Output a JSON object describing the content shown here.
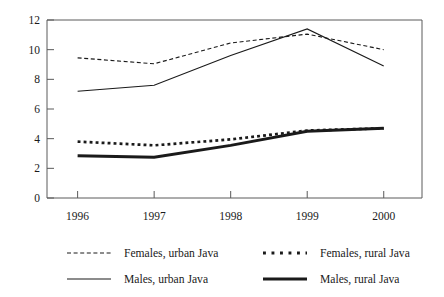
{
  "chart_data": {
    "type": "line",
    "title": "",
    "subtitle": "",
    "xlabel": "",
    "ylabel": "",
    "categories": [
      "1996",
      "1997",
      "1998",
      "1999",
      "2000"
    ],
    "x": [
      1996,
      1997,
      1998,
      1999,
      2000
    ],
    "xlim": [
      1995.6,
      2000.5
    ],
    "ylim": [
      0,
      12
    ],
    "yticks": [
      "0",
      "2",
      "4",
      "6",
      "8",
      "10",
      "12"
    ],
    "ytick_values": [
      0,
      2,
      4,
      6,
      8,
      10,
      12
    ],
    "grid": false,
    "legend_position": "below",
    "series": [
      {
        "name": "Females, urban Java",
        "style": "fine-dashed",
        "values": [
          9.45,
          9.05,
          10.45,
          11.05,
          10.0
        ]
      },
      {
        "name": "Males, urban Java",
        "style": "thin-solid",
        "values": [
          7.2,
          7.6,
          9.6,
          11.4,
          8.9
        ]
      },
      {
        "name": "Females, rural Java",
        "style": "thick-dotted",
        "values": [
          3.8,
          3.55,
          3.95,
          4.55,
          4.7
        ]
      },
      {
        "name": "Males, rural Java",
        "style": "thick-solid",
        "values": [
          2.85,
          2.75,
          3.55,
          4.5,
          4.7
        ]
      }
    ]
  },
  "legend": {
    "entries": [
      {
        "label": "Females, urban Java",
        "style": "fine-dashed"
      },
      {
        "label": "Females, rural Java",
        "style": "thick-dotted"
      },
      {
        "label": "Males, urban Java",
        "style": "thin-solid"
      },
      {
        "label": "Males, rural Java",
        "style": "thick-solid"
      }
    ]
  },
  "colors": {
    "line": "#1a1a1a",
    "axis": "#5a5a5a",
    "background": "#ffffff"
  }
}
